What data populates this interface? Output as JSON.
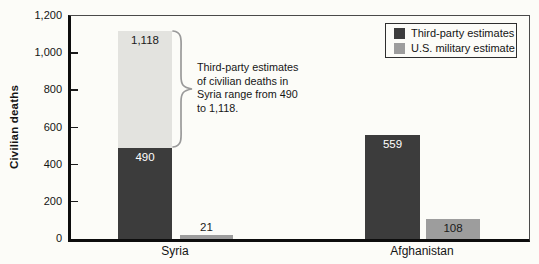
{
  "chart_data": {
    "type": "bar",
    "title": "",
    "xlabel": "",
    "ylabel": "Civilian deaths",
    "ylim": [
      0,
      1200
    ],
    "grid": false,
    "legend_position": "top-right",
    "categories": [
      "Syria",
      "Afghanistan"
    ],
    "series": [
      {
        "name": "Third-party estimates",
        "values": [
          490,
          559
        ]
      },
      {
        "name": "U.S. military estimate",
        "values": [
          21,
          108
        ]
      }
    ],
    "syria_third_party_range": {
      "min": 490,
      "max": 1118
    },
    "yticks": [
      {
        "value": 0,
        "label": "0"
      },
      {
        "value": 200,
        "label": "200"
      },
      {
        "value": 400,
        "label": "400"
      },
      {
        "value": 600,
        "label": "600"
      },
      {
        "value": 800,
        "label": "800"
      },
      {
        "value": 1000,
        "label": "1,000"
      },
      {
        "value": 1200,
        "label": "1,200"
      }
    ],
    "bar_value_labels": {
      "syria_range_top": "1,118",
      "syria_third_party": "490",
      "syria_us": "21",
      "afghanistan_third_party": "559",
      "afghanistan_us": "108"
    },
    "annotation": {
      "text": "Third-party estimates of civilian deaths in Syria range from 490 to 1,118.",
      "lines": [
        "Third-party estimates",
        "of civilian deaths in",
        "Syria range from 490",
        "to 1,118."
      ]
    },
    "legend": {
      "items": [
        {
          "label": "Third-party estimates"
        },
        {
          "label": "U.S. military estimate"
        }
      ]
    },
    "colors": {
      "third_party": "#3c3c3c",
      "us_military": "#9d9d9d",
      "range_light": "#e3e3df",
      "axis": "#0d0d0d",
      "brace": "#9a9a9a"
    }
  }
}
